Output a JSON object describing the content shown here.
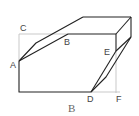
{
  "diagram": {
    "type": "geometry-figure",
    "points": {
      "A": "A",
      "B": "B",
      "C": "C",
      "D": "D",
      "E": "E",
      "F": "F"
    },
    "caption": "B",
    "colors": {
      "line": "#222222",
      "aux_line": "#bbbbbb",
      "label": "#444444"
    }
  }
}
